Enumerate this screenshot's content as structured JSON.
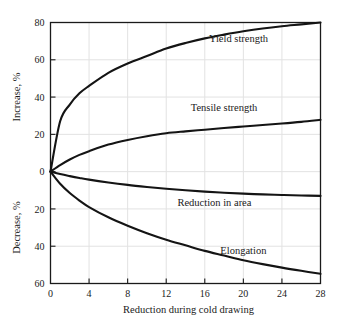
{
  "chart_data": {
    "type": "line",
    "title": "",
    "subtitle": "",
    "xlabel": "Reduction during cold drawing",
    "ylabel_upper": "Increase, %",
    "ylabel_lower": "Decrease, %",
    "xlim": [
      0,
      28
    ],
    "ylim": [
      -60,
      80
    ],
    "xticks": [
      0,
      4,
      8,
      12,
      16,
      20,
      24,
      28
    ],
    "xticklabels": [
      "0",
      "4",
      "8",
      "12",
      "16",
      "20",
      "24",
      "28"
    ],
    "yticks": [
      80,
      60,
      40,
      20,
      0,
      -20,
      -40,
      -60
    ],
    "yticklabels": [
      "80",
      "60",
      "40",
      "20",
      "0",
      "20",
      "40",
      "60"
    ],
    "grid": true,
    "legend_position": "inline-annotations",
    "x": [
      0,
      1,
      2,
      3,
      4,
      6,
      8,
      10,
      12,
      14,
      16,
      18,
      20,
      22,
      24,
      26,
      28
    ],
    "series": [
      {
        "name": "Yield strength",
        "label": "Yield strength",
        "color": "#141414",
        "values": [
          0,
          27,
          36,
          42,
          46,
          53,
          58,
          62,
          66,
          69,
          71.5,
          73.5,
          75.3,
          76.8,
          78,
          79,
          80
        ]
      },
      {
        "name": "Tensile strength",
        "label": "Tensile strength",
        "color": "#141414",
        "values": [
          0,
          3.5,
          6.5,
          9,
          11,
          14.5,
          17,
          19,
          20.6,
          21.6,
          22.5,
          23.4,
          24.2,
          25,
          25.8,
          26.7,
          27.8
        ]
      },
      {
        "name": "Reduction in area",
        "label": "Reduction in area",
        "color": "#141414",
        "values": [
          0,
          -1.3,
          -2.4,
          -3.4,
          -4.3,
          -5.8,
          -7.1,
          -8.2,
          -9.2,
          -10.0,
          -10.7,
          -11.3,
          -11.8,
          -12.2,
          -12.5,
          -12.8,
          -13.0
        ]
      },
      {
        "name": "Elongation",
        "label": "Elongation",
        "color": "#141414",
        "values": [
          0,
          -6.5,
          -11.5,
          -15.5,
          -19,
          -24.5,
          -29,
          -33,
          -36.5,
          -39.5,
          -42.5,
          -45,
          -47.5,
          -49.6,
          -51.5,
          -53.2,
          -54.8
        ]
      }
    ],
    "annotations": [
      {
        "text": "Yield strength",
        "x": 19.5,
        "y": 71.5
      },
      {
        "text": "Tensile strength",
        "x": 18.0,
        "y": 34.5
      },
      {
        "text": "Reduction in area",
        "x": 17.0,
        "y": -16.5
      },
      {
        "text": "Elongation",
        "x": 20.0,
        "y": -42.0
      }
    ]
  },
  "colors": {
    "curve": "#141414",
    "grid": "#e2e2e2",
    "axis": "#1a1a1a",
    "background": "#ffffff"
  }
}
